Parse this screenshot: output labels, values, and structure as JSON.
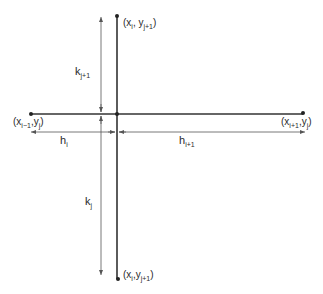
{
  "diagram": {
    "type": "finite-difference-stencil",
    "nodes": {
      "top": {
        "label_main": "(x",
        "sub1": "i",
        "mid": ", y",
        "sub2": "j+1",
        "close": ")"
      },
      "bottom": {
        "label_main": "(x",
        "sub1": "i",
        "mid": ",y",
        "sub2": "j+1",
        "close": ")"
      },
      "left": {
        "label_main": "(x",
        "sub1": "i−1",
        "mid": ",y",
        "sub2": "j",
        "close": ")"
      },
      "right": {
        "label_main": "(x",
        "sub1": "i+1",
        "mid": ",y",
        "sub2": "j",
        "close": ")"
      }
    },
    "dimensions": {
      "k_upper": {
        "base": "k",
        "sub": "j+1"
      },
      "k_lower": {
        "base": "k",
        "sub": "j"
      },
      "h_left": {
        "base": "h",
        "sub": "i"
      },
      "h_right": {
        "base": "h",
        "sub": "i+1"
      }
    },
    "colors": {
      "line": "#333333",
      "arrow": "#555555",
      "text": "#2a2a2a",
      "background": "#ffffff"
    }
  }
}
